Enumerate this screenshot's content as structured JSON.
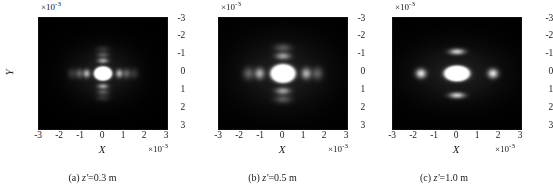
{
  "figure": {
    "panel_count": 3,
    "background_color": "#ffffff",
    "plot_background_color": "#000000",
    "text_color": "#1a1a1a"
  },
  "chart_data": [
    {
      "type": "heatmap",
      "id": "panel-a",
      "title": "(a) z'=0.3 m",
      "caption_index": "(a)",
      "caption_variable": "z'",
      "caption_value": "=0.3 m",
      "xlabel": "X",
      "ylabel": "Y",
      "x_multiplier": "×10",
      "x_multiplier_exponent": "-3",
      "y_multiplier": "×10",
      "y_multiplier_exponent": "-3",
      "xticks": [
        "-3",
        "-2",
        "-1",
        "0",
        "1",
        "2",
        "3"
      ],
      "yticks": [
        "-3",
        "-2",
        "-1",
        "0",
        "1",
        "2",
        "3"
      ],
      "xlim": [
        -3,
        3
      ],
      "ylim": [
        -3,
        3
      ],
      "y_axis_inverted": true,
      "grid": false,
      "colormap": "gray",
      "description": "Intensity distribution: bright compact central lobe with fine horizontal and vertical fringe structure",
      "spot": {
        "center_x": 0.0,
        "center_y": 0.0,
        "core_radius_x": 0.42,
        "core_radius_y": 0.38,
        "ring_count": 3,
        "ring_spacing": 0.3,
        "peak_intensity": 1.0
      }
    },
    {
      "type": "heatmap",
      "id": "panel-b",
      "title": "(b) z'=0.5 m",
      "caption_index": "(b)",
      "caption_variable": "z'",
      "caption_value": "=0.5 m",
      "xlabel": "X",
      "ylabel": "Y",
      "x_multiplier": "×10",
      "x_multiplier_exponent": "-3",
      "y_multiplier": "×10",
      "y_multiplier_exponent": "-3",
      "xticks": [
        "-3",
        "-2",
        "-1",
        "0",
        "1",
        "2",
        "3"
      ],
      "yticks": [
        "-3",
        "-2",
        "-1",
        "0",
        "1",
        "2",
        "3"
      ],
      "xlim": [
        -3,
        3
      ],
      "ylim": [
        -3,
        3
      ],
      "y_axis_inverted": true,
      "grid": false,
      "colormap": "gray",
      "description": "Intensity distribution: larger saturated central lobe surrounded by distinct side lobes",
      "spot": {
        "center_x": 0.0,
        "center_y": 0.0,
        "core_radius_x": 0.58,
        "core_radius_y": 0.5,
        "ring_count": 2,
        "ring_spacing": 0.45,
        "peak_intensity": 1.0
      }
    },
    {
      "type": "heatmap",
      "id": "panel-c",
      "title": "(c) z'=1.0 m",
      "caption_index": "(c)",
      "caption_variable": "z'",
      "caption_value": "=1.0 m",
      "xlabel": "X",
      "ylabel": "Y",
      "x_multiplier": "×10",
      "x_multiplier_exponent": "-3",
      "y_multiplier": "×10",
      "y_multiplier_exponent": "-3",
      "xticks": [
        "-3",
        "-2",
        "-1",
        "0",
        "1",
        "2",
        "3"
      ],
      "yticks": [
        "-3",
        "-2",
        "-1",
        "0",
        "1",
        "2",
        "3"
      ],
      "xlim": [
        -3,
        3
      ],
      "ylim": [
        -3,
        3
      ],
      "y_axis_inverted": true,
      "grid": false,
      "colormap": "gray",
      "description": "Intensity distribution: smooth elliptical central lobe with four separated satellite lobes above, below, left and right",
      "spot": {
        "center_x": 0.0,
        "center_y": 0.0,
        "core_radius_x": 0.6,
        "core_radius_y": 0.42,
        "ring_count": 1,
        "ring_spacing": 0.95,
        "peak_intensity": 1.0
      }
    }
  ]
}
